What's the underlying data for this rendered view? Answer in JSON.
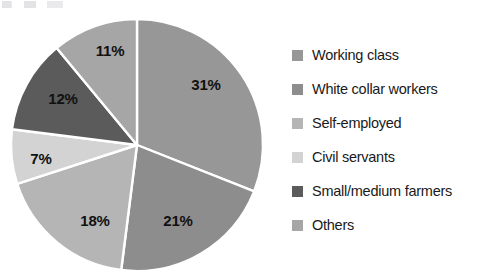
{
  "chart_data": {
    "type": "pie",
    "title": "",
    "subtitle": "",
    "xlabel": "",
    "ylabel": "",
    "legend_position": "right",
    "grid": false,
    "start_angle_deg": 0,
    "direction": "clockwise",
    "categories": [
      "Working class",
      "White collar workers",
      "Self-employed",
      "Civil servants",
      "Small/medium farmers",
      "Others"
    ],
    "values": [
      31,
      21,
      18,
      7,
      12,
      11
    ],
    "value_unit": "%",
    "data_labels": [
      "31%",
      "21%",
      "18%",
      "7%",
      "12%",
      "11%"
    ],
    "colors": [
      "#979797",
      "#8d8d8d",
      "#b5b5b5",
      "#d3d3d3",
      "#5b5b5b",
      "#a6a6a6"
    ],
    "slice_border_color": "#ffffff",
    "slices": [
      {
        "label": "Working class",
        "value": 31,
        "data_label": "31%",
        "color": "#979797",
        "label_x": 206,
        "label_y": 84
      },
      {
        "label": "White collar workers",
        "value": 21,
        "data_label": "21%",
        "color": "#8d8d8d",
        "label_x": 178,
        "label_y": 220
      },
      {
        "label": "Self-employed",
        "value": 18,
        "data_label": "18%",
        "color": "#b5b5b5",
        "label_x": 95,
        "label_y": 220
      },
      {
        "label": "Civil servants",
        "value": 7,
        "data_label": "7%",
        "color": "#d3d3d3",
        "label_x": 41,
        "label_y": 158
      },
      {
        "label": "Small/medium farmers",
        "value": 12,
        "data_label": "12%",
        "color": "#5b5b5b",
        "label_x": 63,
        "label_y": 98
      },
      {
        "label": "Others",
        "value": 11,
        "data_label": "11%",
        "color": "#a6a6a6",
        "label_x": 110,
        "label_y": 50
      }
    ],
    "geometry": {
      "center_x": 137,
      "center_y": 145,
      "radius": 126
    }
  },
  "legend": {
    "items": [
      {
        "label": "Working class",
        "color": "#979797"
      },
      {
        "label": "White collar workers",
        "color": "#8d8d8d"
      },
      {
        "label": "Self-employed",
        "color": "#b5b5b5"
      },
      {
        "label": "Civil servants",
        "color": "#d3d3d3"
      },
      {
        "label": "Small/medium farmers",
        "color": "#5b5b5b"
      },
      {
        "label": "Others",
        "color": "#a6a6a6"
      }
    ]
  }
}
